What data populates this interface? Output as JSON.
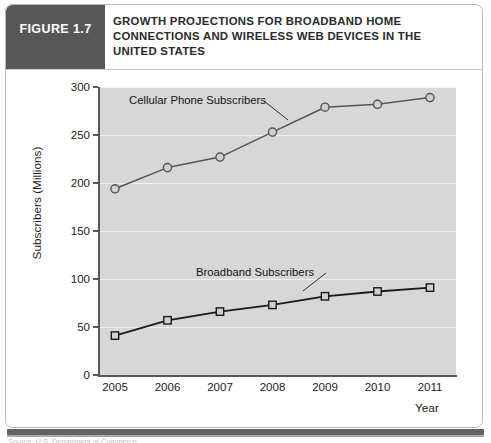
{
  "figure": {
    "badge_label": "FIGURE 1.7",
    "title_lines": [
      "GROWTH PROJECTIONS FOR BROADBAND HOME",
      "CONNECTIONS AND WIRELESS WEB DEVICES IN THE",
      "UNITED STATES"
    ],
    "caption_clipped": "Source: U.S. Department of Commerce"
  },
  "colors": {
    "badge_background": "#575757",
    "plot_background": "#d7d7d7",
    "gridline": "#f2f2f2",
    "axis": "#585858",
    "cellular_line": "#555555",
    "broadband_line": "#1a1a1a",
    "marker_fill": "#d0d0d0",
    "page_background": "#ffffff",
    "frame_border": "#b8b8b8",
    "bottom_bar": "#636363"
  },
  "chart_data": {
    "type": "line",
    "title": "GROWTH PROJECTIONS FOR BROADBAND HOME CONNECTIONS AND WIRELESS WEB DEVICES IN THE UNITED STATES",
    "xlabel": "Year",
    "ylabel": "Subscribers (Millions)",
    "categories": [
      "2005",
      "2006",
      "2007",
      "2008",
      "2009",
      "2010",
      "2011"
    ],
    "x": [
      2005,
      2006,
      2007,
      2008,
      2009,
      2010,
      2011
    ],
    "ylim": [
      0,
      300
    ],
    "yticks": [
      0,
      50,
      100,
      150,
      200,
      250,
      300
    ],
    "grid": true,
    "legend": "annotations",
    "series": [
      {
        "name": "Cellular Phone Subscribers",
        "marker": "circle",
        "values": [
          194,
          216,
          227,
          253,
          279,
          282,
          289
        ]
      },
      {
        "name": "Broadband Subscribers",
        "marker": "square",
        "values": [
          41,
          57,
          66,
          73,
          82,
          87,
          91
        ]
      }
    ],
    "annotations": [
      {
        "text": "Cellular Phone Subscribers",
        "target_series": "Cellular Phone Subscribers"
      },
      {
        "text": "Broadband Subscribers",
        "target_series": "Broadband Subscribers"
      }
    ]
  }
}
